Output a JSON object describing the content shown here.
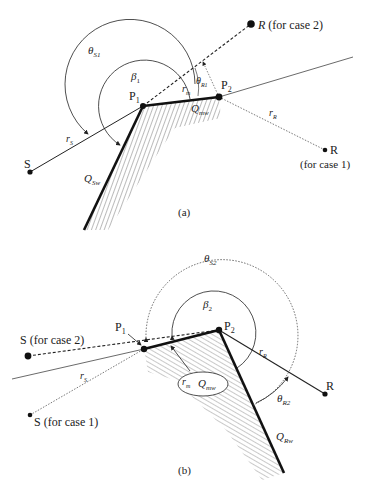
{
  "figure_a": {
    "caption": "(a)",
    "points": {
      "S": "S",
      "P1": "P",
      "P1_sub": "1",
      "P2": "P",
      "P2_sub": "2",
      "R_case2": "R",
      "R_case2_note": "(for case 2)",
      "R_case1": "R",
      "R_case1_note": "(for case 1)"
    },
    "labels": {
      "theta_S1": "θ",
      "theta_S1_sub": "S1",
      "beta_1": "β",
      "beta_1_sub": "1",
      "theta_R1": "θ",
      "theta_R1_sub": "R1",
      "r_m": "r",
      "r_m_sub": "m",
      "Q_mw": "Q",
      "Q_mw_sub": "mw",
      "r_S": "r",
      "r_S_sub": "S",
      "r_R": "r",
      "r_R_sub": "R",
      "Q_Sw": "Q",
      "Q_Sw_sub": "Sw"
    }
  },
  "figure_b": {
    "caption": "(b)",
    "points": {
      "S_case2": "S (for case 2)",
      "S_case1": "S (for case 1)",
      "P1": "P",
      "P1_sub": "1",
      "P2": "P",
      "P2_sub": "2",
      "R": "R"
    },
    "labels": {
      "theta_S2": "θ",
      "theta_S2_sub": "S2",
      "beta_2": "β",
      "beta_2_sub": "2",
      "r_m": "r",
      "r_m_sub": "m",
      "Q_mw": "Q",
      "Q_mw_sub": "mw",
      "r_S": "r",
      "r_S_sub": "S",
      "r_R": "r",
      "r_R_sub": "R",
      "theta_R2": "θ",
      "theta_R2_sub": "R2",
      "Q_Rw": "Q",
      "Q_Rw_sub": "Rw"
    }
  }
}
